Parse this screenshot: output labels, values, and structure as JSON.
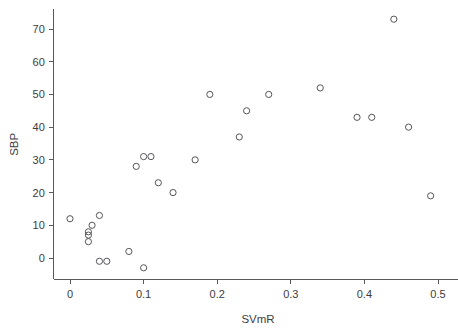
{
  "chart_data": {
    "type": "scatter",
    "title": "",
    "xlabel": "SVmR",
    "ylabel": "SBP",
    "xlim": [
      -0.022,
      0.533
    ],
    "ylim": [
      -6.5,
      76.0
    ],
    "xticks": [
      0,
      0.1,
      0.2,
      0.3,
      0.4,
      0.5
    ],
    "xticklabels": [
      "0",
      "0.1",
      "0.2",
      "0.3",
      "0.4",
      "0.5"
    ],
    "yticks": [
      0,
      10,
      20,
      30,
      40,
      50,
      60,
      70
    ],
    "yticklabels": [
      "0",
      "10",
      "20",
      "30",
      "40",
      "50",
      "60",
      "70"
    ],
    "grid": false,
    "legend": null,
    "marker": "open-circle",
    "marker_color": "#55555a",
    "points": [
      {
        "x": 0.0,
        "y": 12
      },
      {
        "x": 0.025,
        "y": 8
      },
      {
        "x": 0.025,
        "y": 7
      },
      {
        "x": 0.025,
        "y": 5
      },
      {
        "x": 0.03,
        "y": 10
      },
      {
        "x": 0.04,
        "y": 13
      },
      {
        "x": 0.04,
        "y": -1
      },
      {
        "x": 0.05,
        "y": -1
      },
      {
        "x": 0.08,
        "y": 2
      },
      {
        "x": 0.09,
        "y": 28
      },
      {
        "x": 0.1,
        "y": 31
      },
      {
        "x": 0.1,
        "y": -3
      },
      {
        "x": 0.11,
        "y": 31
      },
      {
        "x": 0.12,
        "y": 23
      },
      {
        "x": 0.14,
        "y": 20
      },
      {
        "x": 0.17,
        "y": 30
      },
      {
        "x": 0.19,
        "y": 50
      },
      {
        "x": 0.23,
        "y": 37
      },
      {
        "x": 0.24,
        "y": 45
      },
      {
        "x": 0.27,
        "y": 50
      },
      {
        "x": 0.34,
        "y": 52
      },
      {
        "x": 0.39,
        "y": 43
      },
      {
        "x": 0.41,
        "y": 43
      },
      {
        "x": 0.44,
        "y": 73
      },
      {
        "x": 0.46,
        "y": 40
      },
      {
        "x": 0.49,
        "y": 19
      }
    ]
  },
  "colors": {
    "axis": "#58585a",
    "text": "#3c3c3e",
    "marker": "#55555a",
    "background": "#ffffff"
  }
}
